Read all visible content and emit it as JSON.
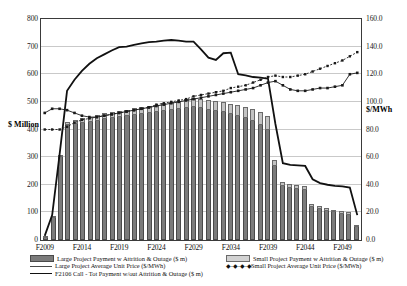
{
  "chart_data": {
    "type": "bar",
    "title": "",
    "xlabel": "",
    "ylabel": "$ Million",
    "y2label": "$/MWh",
    "ylim": [
      0,
      800
    ],
    "y2lim": [
      0,
      160
    ],
    "grid": true,
    "legend_position": "bottom",
    "y_ticks": [
      "0",
      "100",
      "200",
      "300",
      "400",
      "500",
      "600",
      "700",
      "800"
    ],
    "y2_ticks": [
      "0.0",
      "20.0",
      "40.0",
      "60.0",
      "80.0",
      "100.0",
      "120.0",
      "140.0",
      "160.0"
    ],
    "x_tick_labels": [
      "F2009",
      "F2014",
      "F2019",
      "F2024",
      "F2029",
      "F2034",
      "F2039",
      "F2044",
      "F2049"
    ],
    "x_tick_indices": [
      0,
      5,
      10,
      15,
      20,
      25,
      30,
      35,
      40
    ],
    "categories": [
      "F2009",
      "F2010",
      "F2011",
      "F2012",
      "F2013",
      "F2014",
      "F2015",
      "F2016",
      "F2017",
      "F2018",
      "F2019",
      "F2020",
      "F2021",
      "F2022",
      "F2023",
      "F2024",
      "F2025",
      "F2026",
      "F2027",
      "F2028",
      "F2029",
      "F2030",
      "F2031",
      "F2032",
      "F2033",
      "F2034",
      "F2035",
      "F2036",
      "F2037",
      "F2038",
      "F2039",
      "F2040",
      "F2041",
      "F2042",
      "F2043",
      "F2044",
      "F2045",
      "F2046",
      "F2047",
      "F2048",
      "F2049",
      "F2050",
      "F2051"
    ],
    "series": [
      {
        "name": "Large Project Payment w Attrition & Outage ($ m)",
        "type": "bar-stack-bottom",
        "axis": "left",
        "color": "#7b7b7b",
        "values": [
          6,
          80,
          300,
          415,
          420,
          425,
          428,
          432,
          437,
          441,
          445,
          448,
          452,
          456,
          459,
          462,
          466,
          470,
          473,
          477,
          480,
          478,
          472,
          468,
          462,
          455,
          448,
          440,
          430,
          418,
          400,
          268,
          196,
          190,
          186,
          182,
          120,
          112,
          106,
          100,
          95,
          92,
          48
        ]
      },
      {
        "name": "Small Project Payment w Attrition & Outage ($ m)",
        "type": "bar-stack-top",
        "axis": "left",
        "color": "#c3c3c3",
        "values": [
          0,
          2,
          8,
          14,
          16,
          18,
          19,
          20,
          21,
          22,
          23,
          24,
          25,
          26,
          27,
          28,
          29,
          30,
          31,
          32,
          33,
          34,
          35,
          36,
          37,
          38,
          40,
          42,
          44,
          46,
          48,
          22,
          14,
          14,
          14,
          14,
          10,
          10,
          10,
          10,
          10,
          9,
          5
        ]
      },
      {
        "name": "Large Project Average Unit Price ($/MWh)",
        "type": "line-marker",
        "axis": "right",
        "color": "#1a1a1a",
        "values": [
          92,
          95,
          95,
          94,
          92,
          90,
          89,
          89,
          90,
          91,
          92,
          93,
          94,
          95,
          96,
          97,
          98,
          99,
          100,
          101,
          102,
          103,
          104,
          105,
          106,
          107,
          108,
          109,
          110,
          112,
          114,
          115,
          112,
          109,
          108,
          108,
          109,
          110,
          110,
          111,
          112,
          120,
          121
        ]
      },
      {
        "name": "Small Project Average Unit Price ($/MWh)",
        "type": "line-dashed-marker",
        "axis": "right",
        "color": "#1a1a1a",
        "values": [
          80,
          80,
          80,
          82,
          85,
          87,
          88,
          89,
          90,
          91,
          92,
          93,
          94,
          95,
          96,
          98,
          99,
          100,
          101,
          102,
          104,
          105,
          106,
          107,
          108,
          110,
          111,
          112,
          114,
          116,
          118,
          119,
          118,
          118,
          119,
          120,
          122,
          124,
          126,
          128,
          130,
          133,
          136
        ]
      },
      {
        "name": "F2106 Call - Tot Payment w/out Attrition & Outage ($ m)",
        "type": "line-thick",
        "axis": "left",
        "color": "#111111",
        "values": [
          15,
          90,
          310,
          540,
          580,
          612,
          638,
          658,
          672,
          686,
          698,
          700,
          706,
          712,
          716,
          718,
          722,
          724,
          722,
          718,
          718,
          690,
          660,
          652,
          676,
          678,
          600,
          596,
          590,
          588,
          584,
          420,
          278,
          272,
          270,
          268,
          220,
          206,
          200,
          196,
          194,
          190,
          90
        ]
      }
    ]
  },
  "axes": {
    "left_title": "$ Million",
    "right_title": "$/MWh"
  },
  "legend": {
    "items": [
      {
        "label": "Large Project Payment w Attrition & Outage ($ m)",
        "marker": "bar-dark-swatch",
        "column": "left"
      },
      {
        "label": "Large Project Average Unit Price ($/MWh)",
        "marker": "solid-line-swatch",
        "column": "left"
      },
      {
        "label": "F2106 Call - Tot Payment w/out Attrition & Outage ($ m)",
        "marker": "thick-line-swatch",
        "column": "left"
      },
      {
        "label": "Small Project Payment w Attrition & Outage ($ m)",
        "marker": "bar-light-swatch",
        "column": "right"
      },
      {
        "label": "Small Project Average Unit Price ($/MWh)",
        "marker": "dotted-marker-swatch",
        "column": "right"
      }
    ],
    "dot_marker_glyph": "◆-◆-◆-◆"
  },
  "top_partial_title": ""
}
